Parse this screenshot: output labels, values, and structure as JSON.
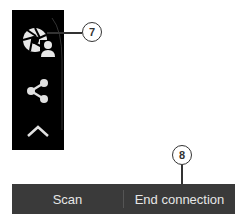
{
  "side_panel": {
    "background": "#000000",
    "icons": [
      {
        "name": "camera-user-icon"
      },
      {
        "name": "share-icon"
      },
      {
        "name": "chevron-up-icon"
      }
    ]
  },
  "callouts": [
    {
      "label": "7"
    },
    {
      "label": "8"
    }
  ],
  "bottom_bar": {
    "background": "#3a3a3a",
    "buttons": [
      {
        "label": "Scan"
      },
      {
        "label": "End connection"
      }
    ]
  }
}
